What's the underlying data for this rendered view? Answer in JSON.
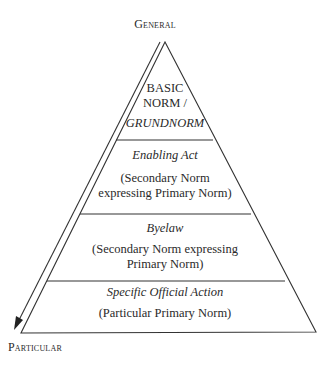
{
  "diagram": {
    "top_label": "General",
    "bottom_label": "Particular",
    "tiers": [
      {
        "title_line1": "BASIC",
        "title_line2": "NORM /",
        "title_italic": "GRUNDNORM"
      },
      {
        "title": "Enabling Act",
        "desc_line1": "(Secondary Norm",
        "desc_line2": "expressing Primary Norm)"
      },
      {
        "title": "Byelaw",
        "desc_line1": "(Secondary Norm expressing",
        "desc_line2": "Primary Norm)"
      },
      {
        "title": "Specific Official Action",
        "desc_line1": "(Particular Primary Norm)"
      }
    ],
    "colors": {
      "line": "#333333",
      "text": "#2a2a2a",
      "background": "#ffffff"
    }
  }
}
